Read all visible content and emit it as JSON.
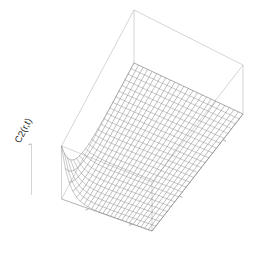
{
  "figure": {
    "type": "3d-surface-wireframe",
    "renderer": "persp-style-wireframe",
    "background_color": "#ffffff",
    "mesh_color": "#7e7e7e",
    "box_color": "#b9b9b9",
    "z_axis_label": "C2(r,t)",
    "x_axis_label": "",
    "y_axis_label": ""
  },
  "axes": {
    "z_label": "C2(r,t)",
    "x_ticks": [
      "",
      ""
    ],
    "y_ticks": [
      "",
      ""
    ],
    "z_ticks": [
      ""
    ]
  },
  "chart_data": {
    "type": "surface",
    "title": "",
    "xlabel": "r",
    "ylabel": "t",
    "zlabel": "C2(r,t)",
    "legend": "none",
    "grid": false,
    "nx": 25,
    "ny": 25,
    "xlim": [
      0,
      1
    ],
    "ylim": [
      0,
      1
    ],
    "zlim": [
      0,
      1
    ],
    "surface_form": "sharp peak at near-left corner decaying monotonically, exponential-like decay in both r and t, flat plateau near zero over most of domain",
    "x": [
      0.0,
      0.0417,
      0.0833,
      0.125,
      0.1667,
      0.2083,
      0.25,
      0.2917,
      0.3333,
      0.375,
      0.4167,
      0.4583,
      0.5,
      0.5417,
      0.5833,
      0.625,
      0.6667,
      0.7083,
      0.75,
      0.7917,
      0.8333,
      0.875,
      0.9167,
      0.9583,
      1.0
    ],
    "y": [
      0.0,
      0.0417,
      0.0833,
      0.125,
      0.1667,
      0.2083,
      0.25,
      0.2917,
      0.3333,
      0.375,
      0.4167,
      0.4583,
      0.5,
      0.5417,
      0.5833,
      0.625,
      0.6667,
      0.7083,
      0.75,
      0.7917,
      0.8333,
      0.875,
      0.9167,
      0.9583,
      1.0
    ],
    "z_description": "z = exp(-12*x) * exp(-7*y) normalized to peak 1.0 at (0,0)",
    "z_peak_value": 1.0,
    "z_peak_at": [
      0.0,
      0.0
    ],
    "z_min_value": 0.0
  },
  "view": {
    "theta_deg": 40,
    "phi_deg": 22,
    "projection": "perspective",
    "box": true,
    "ticktype": "simple"
  }
}
